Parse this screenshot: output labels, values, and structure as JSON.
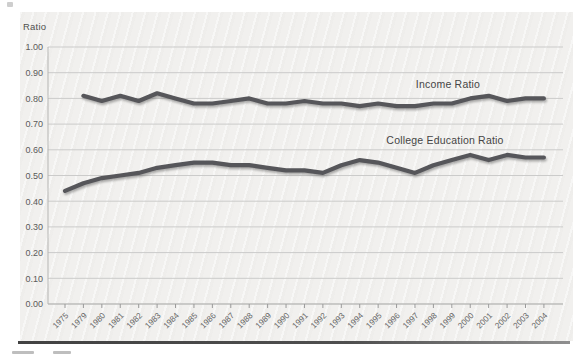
{
  "window": {
    "width": 573,
    "height": 356,
    "background": "#ffffff"
  },
  "panel": {
    "background": "#f1f0ee",
    "gridline_color": "#cbcbca",
    "axis_color": "#b5b5b3",
    "bottom_rule_color": "#4a4a4a"
  },
  "chart_data": {
    "type": "line",
    "title": "",
    "axis_title": "Ratio",
    "xlabel": "",
    "ylabel": "Ratio",
    "ylim": [
      0.0,
      1.0
    ],
    "ytick_step": 0.1,
    "y_ticks": [
      "1.00",
      "0.90",
      "0.80",
      "0.70",
      "0.60",
      "0.50",
      "0.40",
      "0.30",
      "0.20",
      "0.10",
      "0.00"
    ],
    "grid": "horizontal-only",
    "legend": "inline-labels-above-lines",
    "line_color": "#56565a",
    "x_categories": [
      "1975",
      "1979",
      "1980",
      "1981",
      "1982",
      "1983",
      "1984",
      "1985",
      "1986",
      "1987",
      "1988",
      "1989",
      "1990",
      "1991",
      "1992",
      "1993",
      "1994",
      "1995",
      "1996",
      "1997",
      "1998",
      "1999",
      "2000",
      "2001",
      "2002",
      "2003",
      "2004"
    ],
    "series": [
      {
        "name": "Income Ratio",
        "values": [
          null,
          0.81,
          0.79,
          0.81,
          0.79,
          0.82,
          0.8,
          0.78,
          0.78,
          0.79,
          0.8,
          0.78,
          0.78,
          0.79,
          0.78,
          0.78,
          0.77,
          0.78,
          0.77,
          0.77,
          0.78,
          0.78,
          0.8,
          0.81,
          0.79,
          0.8,
          0.8
        ]
      },
      {
        "name": "College Education Ratio",
        "values": [
          0.44,
          0.47,
          0.49,
          0.5,
          0.51,
          0.53,
          0.54,
          0.55,
          0.55,
          0.54,
          0.54,
          0.53,
          0.52,
          0.52,
          0.51,
          0.54,
          0.56,
          0.55,
          0.53,
          0.51,
          0.54,
          0.56,
          0.58,
          0.56,
          0.58,
          0.57,
          0.57
        ]
      }
    ]
  }
}
